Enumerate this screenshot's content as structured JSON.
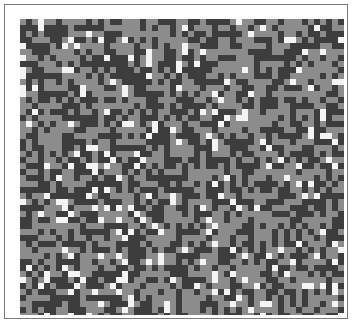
{
  "board": {
    "cols": 54,
    "rows": 50,
    "seed": 12345,
    "palette": {
      "dark": "#3d3d3d",
      "mid": "#8c8c8c",
      "light": "#f4f4f4"
    },
    "probabilities": {
      "dark": 0.45,
      "mid": 0.47,
      "light": 0.08
    }
  }
}
